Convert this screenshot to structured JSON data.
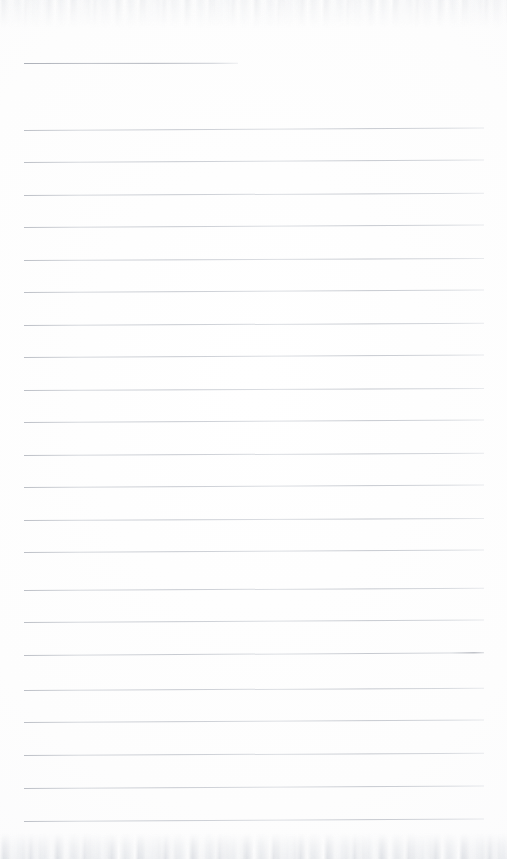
{
  "document": {
    "kind": "scanned-lined-paper",
    "title": "",
    "body_text": "",
    "page_number": "",
    "background_color": "#fdfdfd",
    "rule_color": "#b4b8c0",
    "margin_left_px": 24,
    "margin_right_px": 484,
    "line_spacing_px": 32.4,
    "total_rules": 23
  },
  "rules": [
    {
      "id": "rule-1",
      "y": 62.5,
      "x1": 24,
      "x2": 238,
      "variant": "short",
      "slant_deg": -0.1
    },
    {
      "id": "rule-2",
      "y": 130.0,
      "x1": 24,
      "x2": 484,
      "variant": "full",
      "slant_deg": -0.32
    },
    {
      "id": "rule-3",
      "y": 162.4,
      "x1": 24,
      "x2": 484,
      "variant": "full",
      "slant_deg": -0.3
    },
    {
      "id": "rule-4",
      "y": 194.8,
      "x1": 24,
      "x2": 484,
      "variant": "full",
      "slant_deg": -0.28
    },
    {
      "id": "rule-5",
      "y": 227.2,
      "x1": 24,
      "x2": 484,
      "variant": "full",
      "slant_deg": -0.3
    },
    {
      "id": "rule-6",
      "y": 260.0,
      "x1": 24,
      "x2": 484,
      "variant": "full",
      "slant_deg": -0.26
    },
    {
      "id": "rule-7",
      "y": 292.4,
      "x1": 24,
      "x2": 484,
      "variant": "full",
      "slant_deg": -0.3
    },
    {
      "id": "rule-8",
      "y": 324.8,
      "x1": 24,
      "x2": 484,
      "variant": "full",
      "slant_deg": -0.28
    },
    {
      "id": "rule-9",
      "y": 357.2,
      "x1": 24,
      "x2": 484,
      "variant": "full",
      "slant_deg": -0.3
    },
    {
      "id": "rule-10",
      "y": 389.6,
      "x1": 24,
      "x2": 484,
      "variant": "full",
      "slant_deg": -0.26
    },
    {
      "id": "rule-11",
      "y": 422.0,
      "x1": 24,
      "x2": 484,
      "variant": "full",
      "slant_deg": -0.3
    },
    {
      "id": "rule-12",
      "y": 454.8,
      "x1": 24,
      "x2": 484,
      "variant": "full",
      "slant_deg": -0.28
    },
    {
      "id": "rule-13",
      "y": 487.2,
      "x1": 24,
      "x2": 484,
      "variant": "full",
      "slant_deg": -0.3
    },
    {
      "id": "rule-14",
      "y": 519.6,
      "x1": 24,
      "x2": 484,
      "variant": "full",
      "slant_deg": -0.26
    },
    {
      "id": "rule-15",
      "y": 552.0,
      "x1": 24,
      "x2": 484,
      "variant": "full",
      "slant_deg": -0.3
    },
    {
      "id": "rule-16",
      "y": 590.0,
      "x1": 24,
      "x2": 484,
      "variant": "full",
      "slant_deg": -0.28
    },
    {
      "id": "rule-17",
      "y": 622.4,
      "x1": 24,
      "x2": 484,
      "variant": "full",
      "slant_deg": -0.3
    },
    {
      "id": "rule-18",
      "y": 655.0,
      "x1": 24,
      "x2": 484,
      "variant": "tail",
      "slant_deg": -0.34
    },
    {
      "id": "rule-19",
      "y": 690.0,
      "x1": 24,
      "x2": 484,
      "variant": "full",
      "slant_deg": -0.28
    },
    {
      "id": "rule-20",
      "y": 722.4,
      "x1": 24,
      "x2": 484,
      "variant": "full",
      "slant_deg": -0.3
    },
    {
      "id": "rule-21",
      "y": 755.0,
      "x1": 24,
      "x2": 484,
      "variant": "full",
      "slant_deg": -0.28
    },
    {
      "id": "rule-22",
      "y": 788.0,
      "x1": 24,
      "x2": 484,
      "variant": "full",
      "slant_deg": -0.3
    },
    {
      "id": "rule-23",
      "y": 820.5,
      "x1": 24,
      "x2": 484,
      "variant": "full",
      "slant_deg": -0.3
    }
  ],
  "scan_artifacts": {
    "top_band_label": "",
    "bottom_band_label": ""
  }
}
